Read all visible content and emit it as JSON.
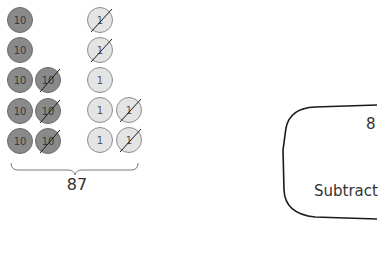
{
  "diagram": {
    "counters": {
      "tens": [
        {
          "label": "10",
          "col": 0,
          "row": 0,
          "crossed": false
        },
        {
          "label": "10",
          "col": 0,
          "row": 1,
          "crossed": false
        },
        {
          "label": "10",
          "col": 0,
          "row": 2,
          "crossed": false
        },
        {
          "label": "10",
          "col": 1,
          "row": 2,
          "crossed": true
        },
        {
          "label": "10",
          "col": 0,
          "row": 3,
          "crossed": false
        },
        {
          "label": "10",
          "col": 1,
          "row": 3,
          "crossed": true
        },
        {
          "label": "10",
          "col": 0,
          "row": 4,
          "crossed": false
        },
        {
          "label": "10",
          "col": 1,
          "row": 4,
          "crossed": true
        }
      ],
      "ones": [
        {
          "label": "1",
          "col": 0,
          "row": 0,
          "crossed": true
        },
        {
          "label": "1",
          "col": 0,
          "row": 1,
          "crossed": true
        },
        {
          "label": "1",
          "col": 0,
          "row": 2,
          "crossed": false
        },
        {
          "label": "1",
          "col": 0,
          "row": 3,
          "crossed": false
        },
        {
          "label": "1",
          "col": 1,
          "row": 3,
          "crossed": true
        },
        {
          "label": "1",
          "col": 0,
          "row": 4,
          "crossed": false
        },
        {
          "label": "1",
          "col": 1,
          "row": 4,
          "crossed": true
        }
      ]
    },
    "total_label": "87",
    "box": {
      "number": "8",
      "label": "Subtract"
    },
    "colors": {
      "ten_fill": "#8a8a8a",
      "one_fill": "#e4e4e4",
      "stroke": "#1a1a1a"
    }
  }
}
